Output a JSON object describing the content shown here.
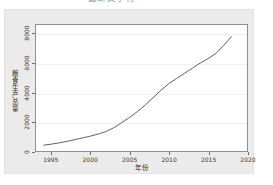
{
  "top_cut_text": "截断文字行",
  "chart_data": {
    "type": "line",
    "title": "",
    "xlabel": "年份",
    "ylabel": "粮食生产总量",
    "xlim": [
      1993,
      2020
    ],
    "ylim": [
      0,
      8600
    ],
    "grid": true,
    "legend": "none",
    "x_ticks": [
      "1995",
      "2000",
      "2005",
      "2010",
      "2015",
      "2020"
    ],
    "x_tick_values": [
      1995,
      2000,
      2005,
      2010,
      2015,
      2020
    ],
    "y_ticks": [
      "0",
      "2000",
      "4000",
      "6000",
      "8000"
    ],
    "y_tick_values": [
      0,
      2000,
      4000,
      6000,
      8000
    ],
    "line_color": "#4a4a5e",
    "series": [
      {
        "name": "粮食生产总量",
        "x": [
          1994,
          1995,
          1996,
          1997,
          1998,
          1999,
          2000,
          2001,
          2002,
          2003,
          2004,
          2005,
          2006,
          2007,
          2008,
          2009,
          2010,
          2011,
          2012,
          2013,
          2014,
          2015,
          2016,
          2017,
          2018
        ],
        "values": [
          400,
          470,
          560,
          660,
          780,
          900,
          1020,
          1160,
          1340,
          1600,
          1950,
          2300,
          2700,
          3150,
          3650,
          4150,
          4600,
          4950,
          5300,
          5650,
          6000,
          6300,
          6650,
          7200,
          7800
        ]
      }
    ]
  }
}
